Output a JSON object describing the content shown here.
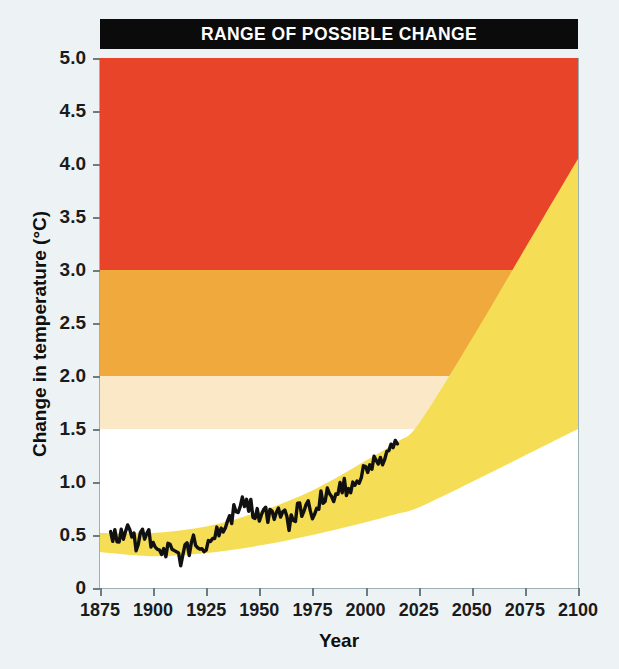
{
  "title": "RANGE OF POSSIBLE CHANGE",
  "colors": {
    "background": "#edf3f4",
    "plot_background": "#ffffff",
    "banner_background": "#0b0b0b",
    "banner_text": "#ffffff",
    "band_red": "#e8442a",
    "band_orange": "#f0a93c",
    "band_cream": "#fbe8c6",
    "band_white": "#ffffff",
    "projection_yellow": "#f5de55",
    "observed_line": "#111111",
    "axis_line": "#9fb0b4",
    "tick": "#6d7c80",
    "label_text": "#1b1b1b"
  },
  "chart_data": {
    "type": "area",
    "title": "RANGE OF POSSIBLE CHANGE",
    "xlabel": "Year",
    "ylabel": "Change in temperature (°C)",
    "xlim": [
      1875,
      2100
    ],
    "ylim": [
      0,
      5.0
    ],
    "grid": false,
    "legend": "none",
    "xticks": [
      1875,
      1900,
      1925,
      1950,
      1975,
      2000,
      2025,
      2050,
      2075,
      2100
    ],
    "xticklabels": [
      "1875",
      "1900",
      "1925",
      "1950",
      "1975",
      "2000",
      "2025",
      "2050",
      "2075",
      "2100"
    ],
    "yticks": [
      0,
      0.5,
      1.0,
      1.5,
      2.0,
      2.5,
      3.0,
      3.5,
      4.0,
      4.5,
      5.0
    ],
    "yticklabels": [
      "0",
      "0.5",
      "1.0",
      "1.5",
      "2.0",
      "2.5",
      "3.0",
      "3.5",
      "4.0",
      "4.5",
      "5.0"
    ],
    "bands": [
      {
        "name": "severe",
        "color": "#e8442a",
        "y_from": 3.0,
        "y_to": 5.0
      },
      {
        "name": "high",
        "color": "#f0a93c",
        "y_from": 2.0,
        "y_to": 3.0
      },
      {
        "name": "moderate",
        "color": "#fbe8c6",
        "y_from": 1.5,
        "y_to": 2.0
      },
      {
        "name": "low",
        "color": "#ffffff",
        "y_from": 0.0,
        "y_to": 1.5
      }
    ],
    "series": [
      {
        "name": "Range of possible change",
        "type": "band",
        "color": "#f5de55",
        "x": [
          1875,
          1900,
          1925,
          1950,
          1975,
          2000,
          2015,
          2025,
          2050,
          2075,
          2100
        ],
        "upper": [
          0.52,
          0.52,
          0.58,
          0.72,
          0.92,
          1.2,
          1.38,
          1.55,
          2.35,
          3.2,
          4.05
        ],
        "lower": [
          0.34,
          0.3,
          0.33,
          0.4,
          0.5,
          0.62,
          0.7,
          0.76,
          1.0,
          1.25,
          1.5
        ]
      },
      {
        "name": "Observed temperature",
        "type": "line",
        "color": "#111111",
        "x": [
          1880,
          1884,
          1888,
          1892,
          1896,
          1900,
          1904,
          1908,
          1912,
          1916,
          1920,
          1924,
          1928,
          1932,
          1936,
          1940,
          1944,
          1948,
          1952,
          1956,
          1960,
          1964,
          1968,
          1972,
          1976,
          1980,
          1984,
          1988,
          1992,
          1996,
          2000,
          2004,
          2008,
          2012,
          2015
        ],
        "y": [
          0.52,
          0.46,
          0.54,
          0.42,
          0.5,
          0.44,
          0.38,
          0.33,
          0.26,
          0.37,
          0.45,
          0.42,
          0.5,
          0.55,
          0.66,
          0.78,
          0.82,
          0.7,
          0.73,
          0.65,
          0.72,
          0.62,
          0.72,
          0.78,
          0.7,
          0.88,
          0.85,
          0.98,
          0.92,
          1.02,
          1.1,
          1.18,
          1.14,
          1.3,
          1.36
        ]
      }
    ]
  },
  "axes": {
    "y_title": "Change in temperature (°C)",
    "x_title": "Year"
  }
}
